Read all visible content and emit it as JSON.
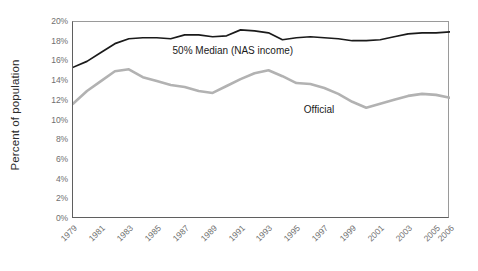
{
  "chart_data": {
    "type": "line",
    "title": "",
    "subtitle": "",
    "xlabel": "",
    "ylabel": "Percent of population",
    "xlim": [
      1979,
      2006
    ],
    "ylim": [
      0,
      20
    ],
    "grid": false,
    "legend_position": "inline-annotation",
    "ytick_labels": [
      "20%",
      "18%",
      "16%",
      "14%",
      "12%",
      "10%",
      "8%",
      "6%",
      "4%",
      "2%",
      "0%"
    ],
    "ytick_values": [
      20,
      18,
      16,
      14,
      12,
      10,
      8,
      6,
      4,
      2,
      0
    ],
    "xtick_labels": [
      "1979",
      "1981",
      "1983",
      "1985",
      "1987",
      "1989",
      "1991",
      "1993",
      "1995",
      "1997",
      "1999",
      "2001",
      "2003",
      "2005",
      "2006"
    ],
    "xtick_values": [
      1979,
      1981,
      1983,
      1985,
      1987,
      1989,
      1991,
      1993,
      1995,
      1997,
      1999,
      2001,
      2003,
      2005,
      2006
    ],
    "x": [
      1979,
      1980,
      1981,
      1982,
      1983,
      1984,
      1985,
      1986,
      1987,
      1988,
      1989,
      1990,
      1991,
      1992,
      1993,
      1994,
      1995,
      1996,
      1997,
      1998,
      1999,
      2000,
      2001,
      2002,
      2003,
      2004,
      2005,
      2006
    ],
    "series": [
      {
        "name": "50% Median (NAS income)",
        "color": "#1a1a1a",
        "annotation": "50% Median (NAS income)",
        "values": [
          15.4,
          16.0,
          16.9,
          17.8,
          18.3,
          18.4,
          18.4,
          18.3,
          18.7,
          18.7,
          18.5,
          18.6,
          19.2,
          19.1,
          18.9,
          18.2,
          18.4,
          18.5,
          18.4,
          18.3,
          18.1,
          18.1,
          18.2,
          18.5,
          18.8,
          18.9,
          18.9,
          19.0
        ]
      },
      {
        "name": "Official",
        "color": "#b2b2b2",
        "annotation": "Official",
        "values": [
          11.7,
          13.0,
          14.0,
          15.0,
          15.2,
          14.4,
          14.0,
          13.6,
          13.4,
          13.0,
          12.8,
          13.5,
          14.2,
          14.8,
          15.1,
          14.5,
          13.8,
          13.7,
          13.3,
          12.7,
          11.9,
          11.3,
          11.7,
          12.1,
          12.5,
          12.7,
          12.6,
          12.3
        ]
      }
    ]
  },
  "axis": {
    "ylabel": "Percent of population"
  }
}
